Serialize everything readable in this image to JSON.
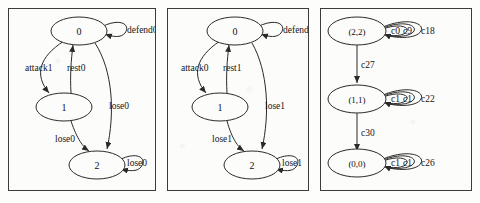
{
  "figure": {
    "type": "state-transition-diagrams",
    "panel_count": 3,
    "stroke_color": "#2a2a2a",
    "background_color": "#fcfcfb"
  },
  "panels": [
    {
      "id": "panel-0",
      "nodes": [
        {
          "id": "n0",
          "label": "0"
        },
        {
          "id": "n1",
          "label": "1"
        },
        {
          "id": "n2",
          "label": "2"
        }
      ],
      "edges": [
        {
          "from": "0",
          "to": "0",
          "label": "defend0",
          "kind": "self-loop"
        },
        {
          "from": "0",
          "to": "1",
          "label": "attack1",
          "kind": "curve-left"
        },
        {
          "from": "1",
          "to": "0",
          "label": "rest0",
          "kind": "straight-up"
        },
        {
          "from": "0",
          "to": "2",
          "label": "lose0",
          "kind": "curve-right"
        },
        {
          "from": "1",
          "to": "2",
          "label": "lose0",
          "kind": "curve-down"
        },
        {
          "from": "2",
          "to": "2",
          "label": "lose0",
          "kind": "self-loop"
        }
      ]
    },
    {
      "id": "panel-1",
      "nodes": [
        {
          "id": "n0",
          "label": "0"
        },
        {
          "id": "n1",
          "label": "1"
        },
        {
          "id": "n2",
          "label": "2"
        }
      ],
      "edges": [
        {
          "from": "0",
          "to": "0",
          "label": "defend1",
          "kind": "self-loop"
        },
        {
          "from": "0",
          "to": "1",
          "label": "attack0",
          "kind": "curve-left"
        },
        {
          "from": "1",
          "to": "0",
          "label": "rest1",
          "kind": "straight-up"
        },
        {
          "from": "0",
          "to": "2",
          "label": "lose1",
          "kind": "curve-right"
        },
        {
          "from": "1",
          "to": "2",
          "label": "lose1",
          "kind": "curve-down"
        },
        {
          "from": "2",
          "to": "2",
          "label": "lose1",
          "kind": "self-loop"
        }
      ]
    },
    {
      "id": "panel-2",
      "nodes": [
        {
          "id": "p0",
          "label": "(2,2)"
        },
        {
          "id": "p1",
          "label": "(1,1)"
        },
        {
          "id": "p2",
          "label": "(0,0)"
        }
      ],
      "edges": [
        {
          "from": "(2,2)",
          "to": "(1,1)",
          "label": "c27",
          "kind": "straight-down"
        },
        {
          "from": "(1,1)",
          "to": "(0,0)",
          "label": "c30",
          "kind": "straight-down"
        }
      ],
      "self_loops": [
        {
          "node": "(2,2)",
          "labels": [
            "c0",
            "c9",
            "c18"
          ]
        },
        {
          "node": "(1,1)",
          "labels": [
            "c1",
            "c1",
            "c22"
          ]
        },
        {
          "node": "(0,0)",
          "labels": [
            "c1",
            "c1",
            "c26"
          ]
        }
      ]
    }
  ]
}
